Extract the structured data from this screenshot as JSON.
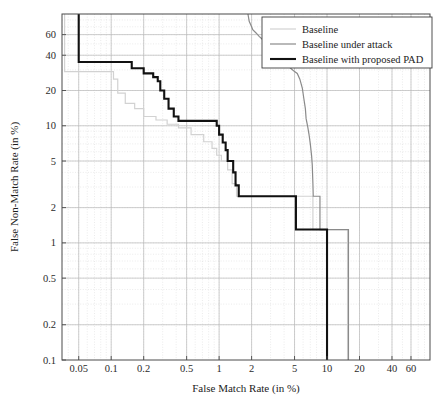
{
  "chart_data": {
    "type": "line",
    "title": "",
    "xlabel": "False Match Rate (in %)",
    "ylabel": "False Non-Match Rate (in %)",
    "xscale": "log",
    "yscale": "log",
    "xlim": [
      0.035,
      90
    ],
    "ylim": [
      0.1,
      90
    ],
    "grid": true,
    "legend_position": "top-right",
    "xticks": [
      0.05,
      0.1,
      0.2,
      0.5,
      1,
      2,
      5,
      10,
      20,
      40,
      60
    ],
    "xticklabels": [
      "0.05",
      "0.1",
      "0.2",
      "0.5",
      "1",
      "2",
      "5",
      "10",
      "20",
      "40",
      "60"
    ],
    "yticks": [
      0.1,
      0.2,
      0.5,
      1,
      2,
      5,
      10,
      20,
      40,
      60
    ],
    "yticklabels": [
      "0.1",
      "0.2",
      "0.5",
      "1",
      "2",
      "5",
      "10",
      "20",
      "40",
      "60"
    ],
    "series": [
      {
        "name": "Baseline",
        "color": "#d2d2d2",
        "width": 1.2,
        "points": [
          [
            0.037,
            90
          ],
          [
            0.037,
            29
          ],
          [
            0.105,
            29
          ],
          [
            0.105,
            25
          ],
          [
            0.115,
            25
          ],
          [
            0.115,
            19
          ],
          [
            0.135,
            19
          ],
          [
            0.135,
            15.5
          ],
          [
            0.165,
            15.5
          ],
          [
            0.165,
            14
          ],
          [
            0.2,
            14
          ],
          [
            0.2,
            12
          ],
          [
            0.26,
            12
          ],
          [
            0.26,
            11.2
          ],
          [
            0.33,
            11.2
          ],
          [
            0.33,
            10.3
          ],
          [
            0.42,
            10.3
          ],
          [
            0.42,
            9.6
          ],
          [
            0.55,
            9.6
          ],
          [
            0.55,
            8.4
          ],
          [
            0.72,
            8.4
          ],
          [
            0.72,
            7.3
          ],
          [
            0.86,
            7.3
          ],
          [
            0.86,
            6.4
          ],
          [
            0.95,
            6.4
          ],
          [
            0.95,
            5.6
          ],
          [
            1.05,
            5.6
          ],
          [
            1.05,
            5.0
          ],
          [
            1.2,
            5.0
          ],
          [
            1.2,
            4.2
          ],
          [
            1.32,
            4.2
          ],
          [
            1.32,
            3.2
          ],
          [
            1.45,
            3.2
          ],
          [
            1.45,
            2.5
          ],
          [
            7.4,
            2.5
          ],
          [
            7.4,
            1.3
          ],
          [
            15.5,
            1.3
          ],
          [
            15.5,
            0.1
          ]
        ]
      },
      {
        "name": "Baseline under attack",
        "color": "#8a8a8a",
        "width": 1.2,
        "points": [
          [
            1.85,
            90
          ],
          [
            1.9,
            78
          ],
          [
            2.0,
            70
          ],
          [
            2.05,
            66
          ],
          [
            2.2,
            62
          ],
          [
            2.35,
            58
          ],
          [
            2.5,
            55
          ],
          [
            2.65,
            52
          ],
          [
            2.85,
            48
          ],
          [
            3.0,
            45
          ],
          [
            3.2,
            43
          ],
          [
            3.4,
            41
          ],
          [
            3.6,
            39
          ],
          [
            3.8,
            37
          ],
          [
            4.0,
            35
          ],
          [
            4.3,
            33
          ],
          [
            4.6,
            31
          ],
          [
            5.0,
            29
          ],
          [
            5.3,
            28
          ],
          [
            5.6,
            25
          ],
          [
            5.9,
            21
          ],
          [
            6.1,
            17
          ],
          [
            6.3,
            14
          ],
          [
            6.4,
            11.5
          ],
          [
            6.6,
            10
          ],
          [
            6.8,
            8.5
          ],
          [
            7.0,
            7.0
          ],
          [
            7.2,
            5.5
          ],
          [
            7.3,
            4.6
          ],
          [
            7.4,
            3.2
          ],
          [
            7.45,
            2.5
          ],
          [
            8.6,
            2.5
          ],
          [
            8.6,
            1.3
          ],
          [
            15.8,
            1.3
          ],
          [
            15.8,
            0.1
          ]
        ]
      },
      {
        "name": "Baseline with proposed PAD",
        "color": "#111111",
        "width": 2.1,
        "points": [
          [
            0.05,
            90
          ],
          [
            0.05,
            35
          ],
          [
            0.155,
            35
          ],
          [
            0.155,
            31
          ],
          [
            0.2,
            31
          ],
          [
            0.2,
            28
          ],
          [
            0.245,
            28
          ],
          [
            0.245,
            26
          ],
          [
            0.27,
            26
          ],
          [
            0.27,
            24
          ],
          [
            0.285,
            24
          ],
          [
            0.285,
            20
          ],
          [
            0.31,
            20
          ],
          [
            0.31,
            17
          ],
          [
            0.34,
            17
          ],
          [
            0.34,
            14
          ],
          [
            0.38,
            14
          ],
          [
            0.38,
            12
          ],
          [
            0.42,
            12
          ],
          [
            0.42,
            11
          ],
          [
            0.95,
            11
          ],
          [
            0.95,
            10
          ],
          [
            1.0,
            10
          ],
          [
            1.0,
            8.4
          ],
          [
            1.08,
            8.4
          ],
          [
            1.08,
            7.2
          ],
          [
            1.15,
            7.2
          ],
          [
            1.15,
            6.2
          ],
          [
            1.2,
            6.2
          ],
          [
            1.2,
            5.0
          ],
          [
            1.35,
            5.0
          ],
          [
            1.35,
            4.0
          ],
          [
            1.42,
            4.0
          ],
          [
            1.42,
            3.1
          ],
          [
            1.52,
            3.1
          ],
          [
            1.52,
            2.5
          ],
          [
            5.15,
            2.5
          ],
          [
            5.15,
            1.3
          ],
          [
            10.0,
            1.3
          ],
          [
            10.0,
            0.1
          ]
        ]
      }
    ]
  },
  "legend": {
    "entries": [
      {
        "label": "Baseline"
      },
      {
        "label": "Baseline under attack"
      },
      {
        "label": "Baseline with proposed PAD"
      }
    ]
  },
  "axes": {
    "x_title": "False Match Rate (in %)",
    "y_title": "False Non-Match Rate (in %)"
  }
}
